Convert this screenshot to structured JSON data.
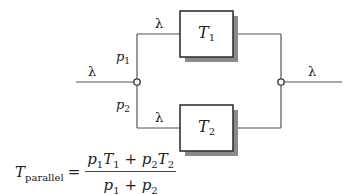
{
  "diagram": {
    "input_rate": "λ",
    "output_rate": "λ",
    "branches": [
      {
        "probability_symbol": "p",
        "probability_index": "1",
        "rate": "λ",
        "server_symbol": "T",
        "server_index": "1"
      },
      {
        "probability_symbol": "p",
        "probability_index": "2",
        "rate": "λ",
        "server_symbol": "T",
        "server_index": "2"
      }
    ],
    "colors": {
      "line": "#555555",
      "box_border": "#333333",
      "shadow": "#8a8a8a"
    }
  },
  "formula": {
    "lhs_symbol": "T",
    "lhs_subscript": "parallel",
    "equals": "=",
    "numerator": {
      "t1_p": "p",
      "t1_p_sub": "1",
      "t1_T": "T",
      "t1_T_sub": "1",
      "plus": "+",
      "t2_p": "p",
      "t2_p_sub": "2",
      "t2_T": "T",
      "t2_T_sub": "2"
    },
    "denominator": {
      "a": "p",
      "a_sub": "1",
      "plus": "+",
      "b": "p",
      "b_sub": "2"
    }
  }
}
